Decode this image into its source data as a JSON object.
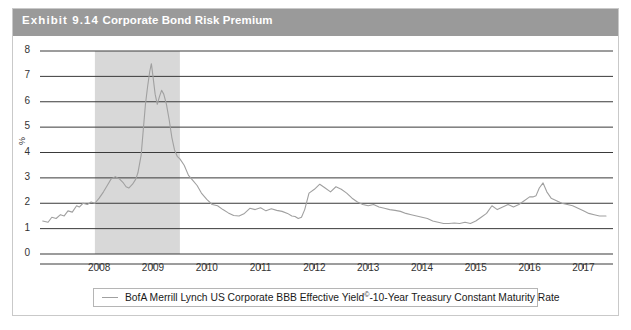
{
  "exhibit": {
    "number_label": "Exhibit 9.14",
    "title": "Corporate Bond Risk Premium"
  },
  "legend": {
    "entries": [
      {
        "label_main": "BofA Merrill Lynch US Corporate BBB Effective Yield",
        "label_sup": "©",
        "label_tail": "-10-Year Treasury Constant Maturity Rate",
        "color": "#a0a0a0"
      }
    ]
  },
  "axes": {
    "y_axis_title": "%",
    "y_ticks": [
      "0",
      "1",
      "2",
      "3",
      "4",
      "5",
      "6",
      "7",
      "8"
    ],
    "x_ticks": [
      "2008",
      "2009",
      "2010",
      "2011",
      "2012",
      "2013",
      "2014",
      "2015",
      "2016",
      "2017"
    ]
  },
  "colors": {
    "header_bar": "#9a9a9a",
    "header_text": "#ffffff",
    "series_line": "#a0a0a0",
    "gridline": "#3a3a3a",
    "recession_shade": "#d8d8d8",
    "card_border": "#c9c9c9"
  },
  "chart_data": {
    "type": "line",
    "title": "Corporate Bond Risk Premium",
    "xlabel": "",
    "ylabel": "%",
    "ylim": [
      0,
      8
    ],
    "xlim": [
      2006.9,
      2017.55
    ],
    "grid": true,
    "legend_position": "bottom",
    "shaded_regions": [
      {
        "label": "recession",
        "x_start": 2007.92,
        "x_end": 2009.5,
        "color": "#d8d8d8"
      }
    ],
    "series": [
      {
        "name": "BofA Merrill Lynch US Corporate BBB Effective Yield©-10-Year Treasury Constant Maturity Rate",
        "color": "#a0a0a0",
        "x": [
          2006.95,
          2007.05,
          2007.12,
          2007.2,
          2007.28,
          2007.35,
          2007.42,
          2007.5,
          2007.58,
          2007.63,
          2007.7,
          2007.78,
          2007.85,
          2007.92,
          2008.0,
          2008.08,
          2008.15,
          2008.22,
          2008.3,
          2008.38,
          2008.45,
          2008.5,
          2008.55,
          2008.62,
          2008.68,
          2008.72,
          2008.78,
          2008.82,
          2008.86,
          2008.9,
          2008.94,
          2008.97,
          2009.0,
          2009.04,
          2009.08,
          2009.12,
          2009.16,
          2009.2,
          2009.25,
          2009.3,
          2009.35,
          2009.4,
          2009.45,
          2009.5,
          2009.58,
          2009.66,
          2009.74,
          2009.82,
          2009.9,
          2010.0,
          2010.1,
          2010.2,
          2010.3,
          2010.4,
          2010.5,
          2010.6,
          2010.7,
          2010.8,
          2010.9,
          2011.0,
          2011.1,
          2011.2,
          2011.3,
          2011.4,
          2011.5,
          2011.58,
          2011.64,
          2011.7,
          2011.76,
          2011.82,
          2011.9,
          2012.0,
          2012.1,
          2012.2,
          2012.3,
          2012.4,
          2012.5,
          2012.6,
          2012.7,
          2012.8,
          2012.9,
          2013.0,
          2013.1,
          2013.2,
          2013.3,
          2013.4,
          2013.5,
          2013.6,
          2013.7,
          2013.8,
          2013.9,
          2014.0,
          2014.1,
          2014.2,
          2014.3,
          2014.4,
          2014.5,
          2014.6,
          2014.7,
          2014.8,
          2014.9,
          2015.0,
          2015.1,
          2015.2,
          2015.3,
          2015.4,
          2015.5,
          2015.6,
          2015.7,
          2015.8,
          2015.9,
          2016.0,
          2016.06,
          2016.12,
          2016.18,
          2016.25,
          2016.32,
          2016.4,
          2016.5,
          2016.6,
          2016.7,
          2016.8,
          2016.9,
          2017.0,
          2017.1,
          2017.2,
          2017.3,
          2017.42
        ],
        "y": [
          1.3,
          1.25,
          1.45,
          1.4,
          1.55,
          1.5,
          1.7,
          1.65,
          1.9,
          1.85,
          2.0,
          1.95,
          2.05,
          2.0,
          2.2,
          2.45,
          2.7,
          2.95,
          3.05,
          2.95,
          2.8,
          2.65,
          2.6,
          2.75,
          2.95,
          3.2,
          3.9,
          4.9,
          5.9,
          6.6,
          7.2,
          7.5,
          7.0,
          6.3,
          5.9,
          6.2,
          6.45,
          6.3,
          5.9,
          5.3,
          4.6,
          4.1,
          3.85,
          3.75,
          3.5,
          3.1,
          2.9,
          2.7,
          2.4,
          2.15,
          1.95,
          1.9,
          1.75,
          1.62,
          1.52,
          1.5,
          1.6,
          1.8,
          1.75,
          1.82,
          1.7,
          1.78,
          1.72,
          1.68,
          1.6,
          1.5,
          1.48,
          1.4,
          1.45,
          1.75,
          2.4,
          2.55,
          2.75,
          2.6,
          2.45,
          2.65,
          2.55,
          2.4,
          2.2,
          2.05,
          1.95,
          1.9,
          1.95,
          1.85,
          1.8,
          1.75,
          1.72,
          1.68,
          1.6,
          1.55,
          1.5,
          1.45,
          1.4,
          1.3,
          1.25,
          1.2,
          1.2,
          1.22,
          1.2,
          1.25,
          1.2,
          1.3,
          1.45,
          1.6,
          1.9,
          1.75,
          1.85,
          1.95,
          1.85,
          1.95,
          2.1,
          2.25,
          2.25,
          2.3,
          2.6,
          2.8,
          2.45,
          2.2,
          2.1,
          2.0,
          1.95,
          1.9,
          1.8,
          1.7,
          1.6,
          1.55,
          1.5,
          1.5
        ]
      }
    ]
  }
}
